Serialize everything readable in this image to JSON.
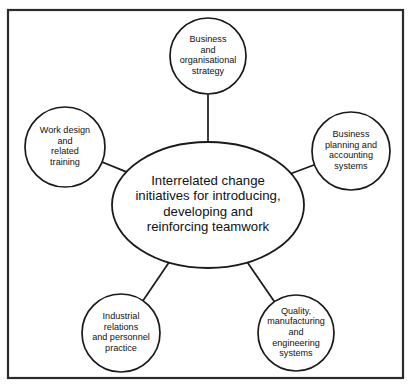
{
  "diagram": {
    "background_color": "#ffffff",
    "stroke_color": "#1a1a1a",
    "frame_color": "#2b2b2b",
    "text_color": "#111111",
    "frame": {
      "x": 8,
      "y": 10,
      "width": 395,
      "height": 368
    },
    "hub": {
      "id": "hub-interrelated-change-initiatives",
      "shape": "ellipse",
      "cx": 208,
      "cy": 205,
      "rx": 96,
      "ry": 63,
      "lines": [
        "Interrelated change",
        "initiatives for introducing,",
        "developing and",
        "reinforcing teamwork"
      ]
    },
    "nodes": [
      {
        "id": "node-business-and-organisational-strategy",
        "name": "Business and organisational strategy",
        "shape": "circle",
        "cx": 208,
        "cy": 56,
        "r": 38,
        "lines": [
          "Business",
          "and",
          "organisational",
          "strategy"
        ]
      },
      {
        "id": "node-business-planning-and-accounting-systems",
        "name": "Business planning and accounting systems",
        "shape": "circle",
        "cx": 351,
        "cy": 151,
        "r": 39,
        "lines": [
          "Business",
          "planning and",
          "accounting",
          "systems"
        ]
      },
      {
        "id": "node-work-design-and-related-training",
        "name": "Work design and related training",
        "shape": "circle",
        "cx": 65,
        "cy": 147,
        "r": 40,
        "lines": [
          "Work design",
          "and",
          "related",
          "training"
        ]
      },
      {
        "id": "node-industrial-relations-and-personnel-practice",
        "name": "Industrial relations and personnel practice",
        "shape": "circle",
        "cx": 121,
        "cy": 333,
        "r": 39,
        "lines": [
          "Industrial",
          "relations",
          "and personnel",
          "practice"
        ]
      },
      {
        "id": "node-quality-manufacturing-and-engineering-systems",
        "name": "Quality, manufacturing and engineering systems",
        "shape": "circle",
        "cx": 296,
        "cy": 333,
        "r": 38,
        "lines": [
          "Quality,",
          "manufacturing",
          "and",
          "engineering",
          "systems"
        ]
      }
    ],
    "connectors": [
      {
        "id": "connector-hub-to-strategy",
        "from": "hub",
        "to": "node-business-and-organisational-strategy"
      },
      {
        "id": "connector-hub-to-planning",
        "from": "hub",
        "to": "node-business-planning-and-accounting-systems"
      },
      {
        "id": "connector-hub-to-work-design",
        "from": "hub",
        "to": "node-work-design-and-related-training"
      },
      {
        "id": "connector-hub-to-industrial",
        "from": "hub",
        "to": "node-industrial-relations-and-personnel-practice"
      },
      {
        "id": "connector-hub-to-quality",
        "from": "hub",
        "to": "node-quality-manufacturing-and-engineering-systems"
      }
    ]
  }
}
